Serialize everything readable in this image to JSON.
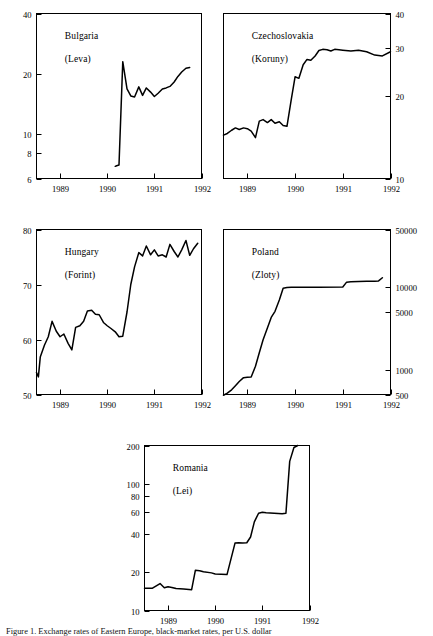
{
  "figure": {
    "caption": "Figure 1. Exchange rates of Eastern Europe, black-market rates, per U.S. dollar"
  },
  "chart_data": [
    {
      "id": "bulgaria",
      "type": "line",
      "title": "Bulgaria",
      "subtitle": "(Leva)",
      "currency": "Leva",
      "yscale": "log",
      "ylim": [
        6,
        40
      ],
      "yticks": [
        6,
        8,
        10,
        20,
        40
      ],
      "ytick_labels": [
        "6",
        "8",
        "10",
        "20",
        "40"
      ],
      "y_axis_side": "left",
      "xlim": [
        1988.5,
        1992.0
      ],
      "xticks": [
        1989,
        1990,
        1991,
        1992
      ],
      "xtick_labels": [
        "1989",
        "1990",
        "1991",
        "1992"
      ],
      "xlabel": "",
      "ylabel": "",
      "grid": false,
      "legend": "none",
      "x": [
        1990.17,
        1990.2,
        1990.25,
        1990.33,
        1990.42,
        1990.5,
        1990.58,
        1990.67,
        1990.75,
        1990.83,
        1990.92,
        1991.0,
        1991.08,
        1991.17,
        1991.25,
        1991.33,
        1991.42,
        1991.5,
        1991.58,
        1991.67,
        1991.75
      ],
      "values": [
        6.9,
        6.95,
        7.0,
        23.0,
        16.8,
        15.5,
        15.3,
        17.2,
        15.6,
        17.0,
        16.2,
        15.4,
        16.0,
        16.8,
        17.0,
        17.3,
        18.2,
        19.4,
        20.4,
        21.3,
        21.5
      ]
    },
    {
      "id": "czechoslovakia",
      "type": "line",
      "title": "Czechoslovakia",
      "subtitle": "(Koruny)",
      "currency": "Koruny",
      "yscale": "log",
      "ylim": [
        10,
        40
      ],
      "yticks": [
        10,
        20,
        30,
        40
      ],
      "ytick_labels": [
        "10",
        "20",
        "30",
        "40"
      ],
      "y_axis_side": "right",
      "xlim": [
        1988.5,
        1992.0
      ],
      "xticks": [
        1989,
        1990,
        1991,
        1992
      ],
      "xtick_labels": [
        "1989",
        "1990",
        "1991",
        "1992"
      ],
      "xlabel": "",
      "ylabel": "",
      "grid": false,
      "legend": "none",
      "x": [
        1988.5,
        1988.58,
        1988.67,
        1988.75,
        1988.83,
        1988.92,
        1989.0,
        1989.08,
        1989.17,
        1989.25,
        1989.33,
        1989.42,
        1989.5,
        1989.58,
        1989.67,
        1989.75,
        1989.83,
        1989.92,
        1990.0,
        1990.08,
        1990.17,
        1990.25,
        1990.33,
        1990.42,
        1990.5,
        1990.58,
        1990.67,
        1990.75,
        1990.83,
        1990.92,
        1991.0,
        1991.17,
        1991.33,
        1991.5,
        1991.67,
        1991.83,
        1992.0
      ],
      "values": [
        14.4,
        14.6,
        15.0,
        15.3,
        15.1,
        15.3,
        15.2,
        14.9,
        14.1,
        16.2,
        16.4,
        16.0,
        16.4,
        15.9,
        16.1,
        15.6,
        15.5,
        19.4,
        23.5,
        23.2,
        26.0,
        27.2,
        27.0,
        28.0,
        29.3,
        29.6,
        29.5,
        29.2,
        29.6,
        29.5,
        29.4,
        29.2,
        29.4,
        29.0,
        28.2,
        28.0,
        29.0
      ]
    },
    {
      "id": "hungary",
      "type": "line",
      "title": "Hungary",
      "subtitle": "(Forint)",
      "currency": "Forint",
      "yscale": "linear",
      "ylim": [
        50,
        80
      ],
      "yticks": [
        50,
        60,
        70,
        80
      ],
      "ytick_labels": [
        "50",
        "60",
        "70",
        "80"
      ],
      "y_axis_side": "left",
      "xlim": [
        1988.5,
        1992.0
      ],
      "xticks": [
        1989,
        1990,
        1991,
        1992
      ],
      "xtick_labels": [
        "1989",
        "1990",
        "1991",
        "1992"
      ],
      "xlabel": "",
      "ylabel": "",
      "grid": false,
      "legend": "none",
      "x": [
        1988.5,
        1988.54,
        1988.58,
        1988.67,
        1988.75,
        1988.83,
        1988.92,
        1989.0,
        1989.08,
        1989.17,
        1989.25,
        1989.33,
        1989.42,
        1989.5,
        1989.58,
        1989.67,
        1989.75,
        1989.83,
        1989.92,
        1990.0,
        1990.08,
        1990.17,
        1990.25,
        1990.33,
        1990.42,
        1990.5,
        1990.58,
        1990.67,
        1990.75,
        1990.83,
        1990.92,
        1991.0,
        1991.08,
        1991.17,
        1991.25,
        1991.33,
        1991.42,
        1991.5,
        1991.58,
        1991.67,
        1991.75,
        1991.83,
        1991.92
      ],
      "values": [
        54.0,
        53.2,
        56.8,
        59.0,
        60.5,
        63.3,
        61.5,
        60.5,
        61.0,
        59.3,
        58.1,
        62.2,
        62.5,
        63.3,
        65.2,
        65.3,
        64.6,
        64.5,
        63.1,
        62.5,
        62.0,
        61.4,
        60.5,
        60.6,
        65.0,
        70.0,
        73.2,
        75.8,
        75.2,
        77.0,
        75.4,
        76.3,
        75.2,
        75.4,
        75.0,
        77.3,
        76.0,
        75.0,
        76.3,
        78.0,
        75.3,
        76.5,
        77.5
      ]
    },
    {
      "id": "poland",
      "type": "line",
      "title": "Poland",
      "subtitle": "(Zloty)",
      "currency": "Zloty",
      "yscale": "log",
      "ylim": [
        500,
        50000
      ],
      "yticks": [
        500,
        1000,
        5000,
        10000,
        50000
      ],
      "ytick_labels": [
        "500",
        "1000",
        "5000",
        "10000",
        "50000"
      ],
      "y_axis_side": "right",
      "xlim": [
        1988.5,
        1992.0
      ],
      "xticks": [
        1989,
        1990,
        1991,
        1992
      ],
      "xtick_labels": [
        "1989",
        "1990",
        "1991",
        "1992"
      ],
      "xlabel": "",
      "ylabel": "",
      "grid": false,
      "legend": "none",
      "x": [
        1988.5,
        1988.58,
        1988.67,
        1988.75,
        1988.83,
        1988.92,
        1989.0,
        1989.08,
        1989.17,
        1989.25,
        1989.33,
        1989.42,
        1989.5,
        1989.58,
        1989.67,
        1989.75,
        1989.83,
        1989.92,
        1990.0,
        1990.5,
        1991.0,
        1991.08,
        1991.17,
        1991.33,
        1991.5,
        1991.67,
        1991.75,
        1991.83
      ],
      "values": [
        490,
        520,
        570,
        640,
        720,
        800,
        810,
        815,
        1100,
        1600,
        2300,
        3200,
        4300,
        5100,
        7000,
        9700,
        9900,
        9950,
        10000,
        10000,
        10050,
        11500,
        11600,
        11700,
        11800,
        11800,
        11900,
        13000
      ]
    },
    {
      "id": "romania",
      "type": "line",
      "title": "Romania",
      "subtitle": "(Lei)",
      "currency": "Lei",
      "yscale": "log",
      "ylim": [
        10,
        200
      ],
      "yticks": [
        10,
        20,
        40,
        60,
        80,
        100,
        200
      ],
      "ytick_labels": [
        "10",
        "20",
        "40",
        "60",
        "80",
        "100",
        "200"
      ],
      "y_axis_side": "left",
      "xlim": [
        1988.5,
        1992.0
      ],
      "xticks": [
        1989,
        1990,
        1991,
        1992
      ],
      "xtick_labels": [
        "1989",
        "1990",
        "1991",
        "1992"
      ],
      "xlabel": "",
      "ylabel": "",
      "grid": false,
      "legend": "none",
      "x": [
        1988.5,
        1988.67,
        1988.83,
        1988.92,
        1989.0,
        1989.08,
        1989.17,
        1989.33,
        1989.5,
        1989.58,
        1989.67,
        1989.75,
        1989.92,
        1990.0,
        1990.25,
        1990.42,
        1990.5,
        1990.58,
        1990.67,
        1990.75,
        1990.83,
        1990.92,
        1991.0,
        1991.08,
        1991.25,
        1991.42,
        1991.5,
        1991.58,
        1991.67,
        1991.75
      ],
      "values": [
        15.0,
        15.0,
        16.3,
        15.1,
        15.4,
        15.2,
        14.9,
        14.8,
        14.6,
        20.8,
        20.6,
        20.2,
        19.8,
        19.4,
        19.2,
        34.0,
        34.2,
        34.0,
        34.2,
        38.0,
        50.0,
        58.5,
        59.5,
        59.0,
        58.5,
        58.0,
        58.5,
        150.0,
        193.0,
        200.0
      ]
    }
  ]
}
